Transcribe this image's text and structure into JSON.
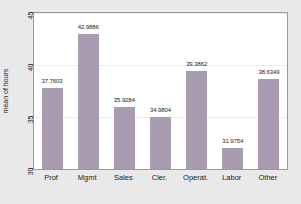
{
  "chart_data": {
    "type": "bar",
    "title": "",
    "subtitle": "",
    "xlabel": "",
    "ylabel": "mean of hours",
    "categories": [
      "Prof",
      "Mgmt",
      "Sales",
      "Cler.",
      "Operat.",
      "Labor",
      "Other"
    ],
    "values": [
      37.7603,
      42.9886,
      35.9284,
      34.9804,
      39.3862,
      31.9754,
      38.6349
    ],
    "value_labels": [
      "37.7603",
      "42.9886",
      "35.9284",
      "34.9804",
      "39.3862",
      "31.9754",
      "38.6349"
    ],
    "ylim": [
      30,
      45
    ],
    "yticks": [
      30,
      35,
      40,
      45
    ],
    "ytick_labels": [
      "30",
      "35",
      "40",
      "45"
    ],
    "grid": true,
    "legend": null,
    "legend_position": "none",
    "bar_color": "#a99cb0",
    "plot_background": "#ffffff",
    "figure_background": "#e9e9ea",
    "gridline_color": "#ececed",
    "axis_color": "#6d6d70",
    "text_color": "#1b1b1b"
  }
}
